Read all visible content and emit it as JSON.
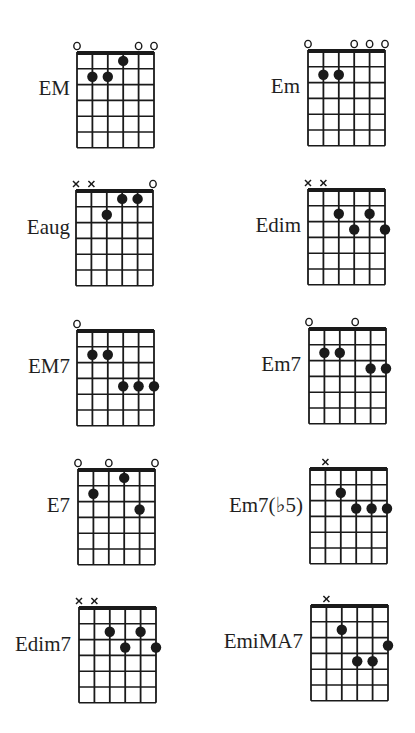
{
  "page": {
    "background": "#ffffff",
    "ink_color": "#1a1a1a"
  },
  "grid": {
    "strings": 6,
    "frets": 6,
    "cell_width": 15.4,
    "row_height": 15.8
  },
  "chords": [
    {
      "name": "EM",
      "grid_x": 77,
      "grid_y": 53,
      "label_right": 70,
      "label_y": 89,
      "markers": [
        "o",
        "",
        "",
        "",
        "o",
        "o"
      ],
      "dots": [
        [
          3,
          1
        ],
        [
          1,
          2
        ],
        [
          2,
          2
        ]
      ]
    },
    {
      "name": "Em",
      "grid_x": 308,
      "grid_y": 51,
      "label_right": 300,
      "label_y": 87,
      "markers": [
        "o",
        "",
        "",
        "o",
        "o",
        "o"
      ],
      "dots": [
        [
          1,
          2
        ],
        [
          2,
          2
        ]
      ]
    },
    {
      "name": "Eaug",
      "grid_x": 76,
      "grid_y": 191,
      "label_right": 70,
      "label_y": 228,
      "markers": [
        "x",
        "x",
        "",
        "",
        "",
        "o"
      ],
      "dots": [
        [
          3,
          1
        ],
        [
          4,
          1
        ],
        [
          2,
          2
        ]
      ]
    },
    {
      "name": "Edim",
      "grid_x": 308,
      "grid_y": 190,
      "label_right": 301,
      "label_y": 226,
      "markers": [
        "x",
        "x",
        "",
        "",
        "",
        ""
      ],
      "dots": [
        [
          2,
          2
        ],
        [
          4,
          2
        ],
        [
          3,
          3
        ],
        [
          5,
          3
        ]
      ]
    },
    {
      "name": "EM7",
      "grid_x": 77,
      "grid_y": 331,
      "label_right": 70,
      "label_y": 367,
      "markers": [
        "o",
        "",
        "",
        "",
        "",
        ""
      ],
      "dots": [
        [
          1,
          2
        ],
        [
          2,
          2
        ],
        [
          3,
          4
        ],
        [
          4,
          4
        ],
        [
          5,
          4
        ]
      ]
    },
    {
      "name": "Em7",
      "grid_x": 309,
      "grid_y": 329,
      "label_right": 301,
      "label_y": 365,
      "markers": [
        "o",
        "",
        "",
        "o",
        "",
        ""
      ],
      "dots": [
        [
          1,
          2
        ],
        [
          2,
          2
        ],
        [
          4,
          3
        ],
        [
          5,
          3
        ]
      ]
    },
    {
      "name": "E7",
      "grid_x": 78,
      "grid_y": 470,
      "label_right": 70,
      "label_y": 506,
      "markers": [
        "o",
        "",
        "o",
        "",
        "",
        "o"
      ],
      "dots": [
        [
          3,
          1
        ],
        [
          1,
          2
        ],
        [
          4,
          3
        ]
      ]
    },
    {
      "name": "Em7(♭5)",
      "grid_x": 310,
      "grid_y": 469,
      "label_right": 303,
      "label_y": 506,
      "markers": [
        "",
        "x",
        "",
        "",
        "",
        ""
      ],
      "dots": [
        [
          2,
          2
        ],
        [
          3,
          3
        ],
        [
          4,
          3
        ],
        [
          5,
          3
        ]
      ]
    },
    {
      "name": "Edim7",
      "grid_x": 79,
      "grid_y": 608,
      "label_right": 71,
      "label_y": 645,
      "markers": [
        "x",
        "x",
        "",
        "",
        "",
        ""
      ],
      "dots": [
        [
          2,
          2
        ],
        [
          4,
          2
        ],
        [
          3,
          3
        ],
        [
          5,
          3
        ]
      ]
    },
    {
      "name": "EmiMA7",
      "grid_x": 311,
      "grid_y": 606,
      "label_right": 303,
      "label_y": 642,
      "markers": [
        "",
        "x",
        "",
        "",
        "",
        ""
      ],
      "dots": [
        [
          2,
          2
        ],
        [
          5,
          3
        ],
        [
          3,
          4
        ],
        [
          4,
          4
        ]
      ]
    }
  ]
}
